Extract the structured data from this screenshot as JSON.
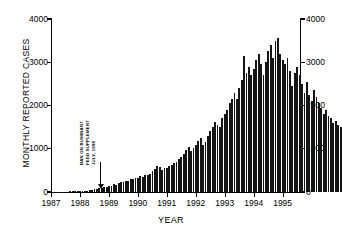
{
  "chart_data": {
    "type": "bar",
    "title": "",
    "xlabel": "YEAR",
    "ylabel": "MONTHLY REPORTED CASES",
    "ylim": [
      0,
      4000
    ],
    "xlim": [
      1987.0,
      1995.6
    ],
    "grid": false,
    "legend": null,
    "yticks": [
      0,
      1000,
      2000,
      3000,
      4000
    ],
    "ytick_labels_left": [
      "0",
      "1000",
      "2000",
      "3000",
      "4000"
    ],
    "ytick_labels_right": [
      "0",
      "1000",
      "2000",
      "3000",
      "4000"
    ],
    "xticks": [
      1987,
      1988,
      1989,
      1990,
      1991,
      1992,
      1993,
      1994,
      1995
    ],
    "xtick_labels": [
      "1987",
      "1988",
      "1989",
      "1990",
      "1991",
      "1992",
      "1993",
      "1994",
      "1995"
    ],
    "annotations": [
      {
        "name": "feed-ban-marker",
        "lines": [
          "BAN ON RUMINANT",
          "FEED SUPPLEMENT",
          "JULY, 1988"
        ],
        "points_to_x": 1988.55,
        "rotation": -90
      }
    ],
    "x_unit": "month",
    "x_start": 1987.0,
    "series": [
      {
        "name": "Monthly reported cases",
        "color": "#151515",
        "values": [
          4,
          6,
          5,
          8,
          7,
          10,
          9,
          14,
          12,
          18,
          22,
          26,
          20,
          34,
          30,
          52,
          46,
          70,
          62,
          96,
          88,
          120,
          112,
          150,
          140,
          175,
          168,
          205,
          235,
          225,
          265,
          255,
          300,
          290,
          330,
          320,
          360,
          350,
          395,
          385,
          420,
          480,
          540,
          600,
          575,
          520,
          560,
          545,
          590,
          620,
          660,
          700,
          760,
          820,
          880,
          960,
          1030,
          940,
          1010,
          1090,
          1170,
          1240,
          1080,
          1160,
          1300,
          1420,
          1500,
          1620,
          1560,
          1500,
          1720,
          1800,
          1900,
          2050,
          2150,
          2300,
          2150,
          2400,
          2600,
          3150,
          2750,
          2900,
          2700,
          2850,
          3050,
          3200,
          2950,
          2700,
          3000,
          3250,
          3400,
          3100,
          3500,
          3550,
          3200,
          3050,
          2950,
          3100,
          2800,
          2450,
          2750,
          2900,
          2700,
          2500,
          2300,
          2550,
          2250,
          2100,
          2350,
          2200,
          2050,
          1950,
          1800,
          1900,
          1750,
          1700,
          1600,
          1650,
          1550,
          1500,
          1700,
          1600,
          1450,
          1350,
          1250,
          1300,
          1200,
          1150,
          1250,
          1180,
          1100,
          1050
        ]
      }
    ]
  }
}
